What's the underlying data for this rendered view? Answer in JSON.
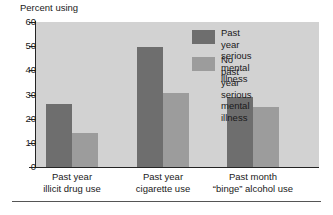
{
  "chart_data": {
    "type": "bar",
    "title": "",
    "ylabel": "Percent using",
    "xlabel": "",
    "ylim": [
      0,
      60
    ],
    "yticks": [
      0,
      10,
      20,
      30,
      40,
      50,
      60
    ],
    "ytick_labels": [
      "0",
      "10",
      "20",
      "30",
      "40",
      "50",
      "60"
    ],
    "grid": false,
    "legend_position": "upper right",
    "categories": [
      "Past year\nillicit drug use",
      "Past year\ncigarette use",
      "Past month\n“binge” alcohol use"
    ],
    "category_lines": [
      [
        "Past year",
        "illicit drug use"
      ],
      [
        "Past year",
        "cigarette use"
      ],
      [
        "Past month",
        "“binge” alcohol use"
      ]
    ],
    "series": [
      {
        "name": "Past year serious\nmental illness",
        "name_lines": [
          "Past year serious",
          "mental illness"
        ],
        "color": "#6e6e6e",
        "values": [
          26,
          49.5,
          29
        ]
      },
      {
        "name": "No past year serious\nmental illness",
        "name_lines": [
          "No past year serious",
          "mental illness"
        ],
        "color": "#9c9c9c",
        "values": [
          14,
          30.5,
          25
        ]
      }
    ],
    "plot_background": "#d2d2d2",
    "axis_color": "#242424",
    "page_background": "#ffffff"
  },
  "yaxis": {
    "title": "Percent using",
    "labels": [
      "60",
      "50",
      "40",
      "30",
      "20",
      "10",
      "0"
    ]
  },
  "legend": {
    "entries": [
      {
        "line1": "Past year serious",
        "line2": "mental illness"
      },
      {
        "line1": "No past year serious",
        "line2": "mental illness"
      }
    ]
  },
  "xaxis": {
    "groups": [
      {
        "line1": "Past year",
        "line2": "illicit drug use"
      },
      {
        "line1": "Past year",
        "line2": "cigarette use"
      },
      {
        "line1": "Past month",
        "line2": "“binge” alcohol use"
      }
    ]
  }
}
